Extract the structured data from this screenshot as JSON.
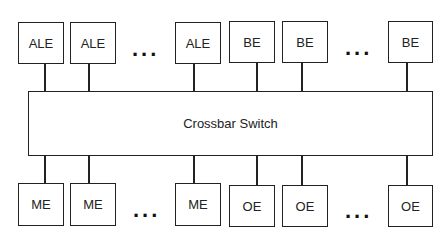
{
  "diagram": {
    "switch_label": "Crossbar Switch",
    "top_row": [
      {
        "label": "ALE"
      },
      {
        "label": "ALE"
      },
      {
        "label": "ALE"
      },
      {
        "label": "BE"
      },
      {
        "label": "BE"
      },
      {
        "label": "BE"
      }
    ],
    "bottom_row": [
      {
        "label": "ME"
      },
      {
        "label": "ME"
      },
      {
        "label": "ME"
      },
      {
        "label": "OE"
      },
      {
        "label": "OE"
      },
      {
        "label": "OE"
      }
    ],
    "ellipsis": "..."
  }
}
